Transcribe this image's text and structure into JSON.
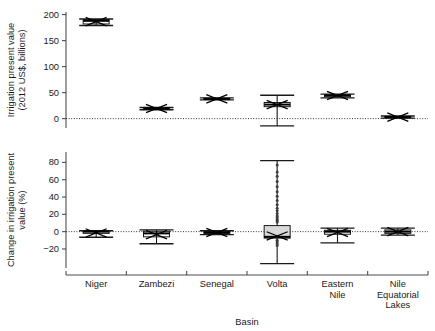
{
  "figure": {
    "title": "",
    "x_axis_title": "Basin",
    "categories": [
      "Niger",
      "Zambezi",
      "Senegal",
      "Volta",
      "Eastern Nile",
      "Nile Equatorial Lakes"
    ],
    "category_lines": [
      [
        "Niger"
      ],
      [
        "Zambezi"
      ],
      [
        "Senegal"
      ],
      [
        "Volta"
      ],
      [
        "Eastern",
        "Nile"
      ],
      [
        "Nile",
        "Equatorial",
        "Lakes"
      ]
    ],
    "category_labels_flat": [
      "Niger",
      "Zambezi",
      "Senegal",
      "Volta",
      "Eastern Nile",
      "Nile Equatorial Lakes"
    ]
  },
  "panels": {
    "top": {
      "ylabel_lines": [
        "Irrigation present value",
        "(2012 US$, billions)"
      ],
      "ylabel": "Irrigation present value (2012 US$, billions)",
      "yticks": [
        0,
        50,
        100,
        150,
        200
      ],
      "ytick_labels": [
        "0",
        "50",
        "100",
        "150",
        "200"
      ],
      "ylim": [
        -18,
        205
      ],
      "zero_reference": 0
    },
    "bottom": {
      "ylabel_lines": [
        "Change in irrigation present",
        "value (%)"
      ],
      "ylabel": "Change in irrigation present value (%)",
      "yticks": [
        -20,
        0,
        20,
        40,
        60,
        80
      ],
      "ytick_labels": [
        "-20",
        "0",
        "20",
        "40",
        "60",
        "80"
      ],
      "ylim": [
        -42,
        92
      ],
      "zero_reference": 0
    }
  },
  "chart_data": {
    "type": "box",
    "title": "",
    "xlabel": "Basin",
    "categories": [
      "Niger",
      "Zambezi",
      "Senegal",
      "Volta",
      "Eastern Nile",
      "Nile Equatorial Lakes"
    ],
    "panels": [
      {
        "id": "top",
        "ylabel": "Irrigation present value (2012 US$, billions)",
        "ylim": [
          -18,
          205
        ],
        "yticks": [
          0,
          50,
          100,
          150,
          200
        ],
        "grid": false,
        "zero_line": true,
        "legend": "none",
        "series": [
          {
            "name": "Niger",
            "min": 179.0,
            "q1": 182.0,
            "median": 188.0,
            "q3": 190.5,
            "max": 191.5,
            "mean": 186.5,
            "outliers": []
          },
          {
            "name": "Zambezi",
            "min": 17.0,
            "q1": 18.0,
            "median": 19.5,
            "q3": 20.5,
            "max": 21.5,
            "mean": 19.5,
            "outliers": []
          },
          {
            "name": "Senegal",
            "min": 36.0,
            "q1": 37.0,
            "median": 38.0,
            "q3": 39.0,
            "max": 40.0,
            "mean": 38.0,
            "outliers": []
          },
          {
            "name": "Volta",
            "min": -14.0,
            "q1": 23.0,
            "median": 27.0,
            "q3": 31.0,
            "max": 45.0,
            "mean": 27.0,
            "outliers": []
          },
          {
            "name": "Eastern Nile",
            "min": 40.0,
            "q1": 42.0,
            "median": 44.5,
            "q3": 46.0,
            "max": 47.0,
            "mean": 44.5,
            "outliers": []
          },
          {
            "name": "Nile Equatorial Lakes",
            "min": 1.0,
            "q1": 2.0,
            "median": 3.0,
            "q3": 4.0,
            "max": 5.0,
            "mean": 3.0,
            "outliers": []
          }
        ]
      },
      {
        "id": "bottom",
        "ylabel": "Change in irrigation present value (%)",
        "ylim": [
          -42,
          92
        ],
        "yticks": [
          -20,
          0,
          20,
          40,
          60,
          80
        ],
        "grid": false,
        "zero_line": true,
        "legend": "none",
        "series": [
          {
            "name": "Niger",
            "min": -6.5,
            "q1": -2.0,
            "median": 0.0,
            "q3": 0.5,
            "max": 1.0,
            "mean": -1.5,
            "outliers": []
          },
          {
            "name": "Zambezi",
            "min": -14.0,
            "q1": -6.0,
            "median": -2.0,
            "q3": 0.5,
            "max": 2.0,
            "mean": -3.5,
            "outliers": []
          },
          {
            "name": "Senegal",
            "min": -3.5,
            "q1": -2.0,
            "median": -1.0,
            "q3": 0.0,
            "max": 1.0,
            "mean": -1.0,
            "outliers": []
          },
          {
            "name": "Volta",
            "min": -37.0,
            "q1": -7.5,
            "median": -6.0,
            "q3": 7.0,
            "max": 82.0,
            "mean": -5.0,
            "outliers": [
              77.0,
              69.0,
              64.0,
              58.0,
              52.0,
              46.0,
              41.0,
              36.0,
              31.0,
              27.0,
              24.0,
              21.0,
              18.0,
              16.0,
              14.0,
              12.5,
              11.0,
              -10.0,
              -12.0,
              -14.0,
              -16.0
            ]
          },
          {
            "name": "Eastern Nile",
            "min": -13.0,
            "q1": -3.0,
            "median": 0.0,
            "q3": 1.5,
            "max": 4.0,
            "mean": -1.0,
            "outliers": []
          },
          {
            "name": "Nile Equatorial Lakes",
            "min": -4.0,
            "q1": -2.0,
            "median": 0.0,
            "q3": 2.0,
            "max": 4.0,
            "mean": 0.0,
            "outliers": []
          }
        ]
      }
    ]
  },
  "colors": {
    "axis": "#4d4d4d",
    "box_stroke": "#1a1a1a",
    "box_fill": "#d9d9d9",
    "zero_line": "#333333",
    "text": "#1a1a1a",
    "background": "#ffffff"
  }
}
